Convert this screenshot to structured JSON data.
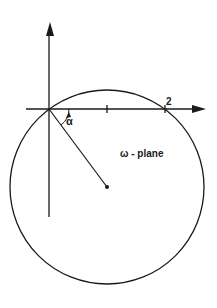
{
  "diagram": {
    "plane_label": "ω - plane",
    "angle_label": "α",
    "tick_label_2": "2",
    "colors": {
      "stroke": "#1a1a1a",
      "background": "#ffffff"
    },
    "geometry": {
      "origin": [
        49,
        109
      ],
      "circle_center": [
        107,
        187
      ],
      "circle_radius": 97,
      "tick_marks_x": [
        107,
        165
      ]
    }
  }
}
